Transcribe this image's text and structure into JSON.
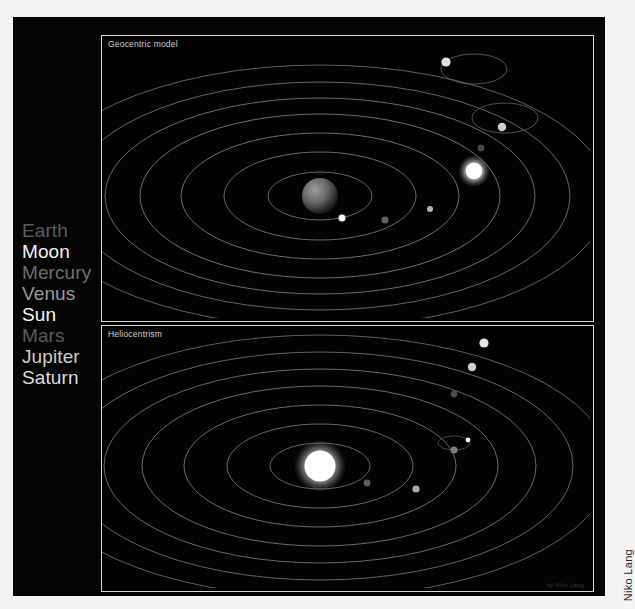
{
  "figure": {
    "side_credit": "Niko Lang",
    "inline_credit": "by Niko Lang",
    "bottom_caption": ""
  },
  "legend": {
    "items": [
      {
        "label": "Earth",
        "color": "#5a5a5a"
      },
      {
        "label": "Moon",
        "color": "#f2f2f2"
      },
      {
        "label": "Mercury",
        "color": "#6e6e6e"
      },
      {
        "label": "Venus",
        "color": "#9a9a9a"
      },
      {
        "label": "Sun",
        "color": "#f5f5f5"
      },
      {
        "label": "Mars",
        "color": "#595959"
      },
      {
        "label": "Jupiter",
        "color": "#cdcdcd"
      },
      {
        "label": "Saturn",
        "color": "#dcdcdc"
      }
    ]
  },
  "panels": [
    {
      "id": "geocentric",
      "title": "Geocentric model",
      "center_body": "Earth",
      "bodies": [
        "Moon",
        "Mercury",
        "Venus",
        "Sun",
        "Mars",
        "Jupiter",
        "Saturn"
      ]
    },
    {
      "id": "heliocentric",
      "title": "Heliocentrism",
      "center_body": "Sun",
      "bodies": [
        "Mercury",
        "Venus",
        "Earth",
        "Moon",
        "Mars",
        "Jupiter",
        "Saturn"
      ]
    }
  ],
  "colors": {
    "plate_background": "#050505",
    "panel_background": "#030303",
    "panel_border": "#d8d8d8",
    "orbit_line": "#8d8d8d",
    "page_background": "#f4f3f1"
  }
}
